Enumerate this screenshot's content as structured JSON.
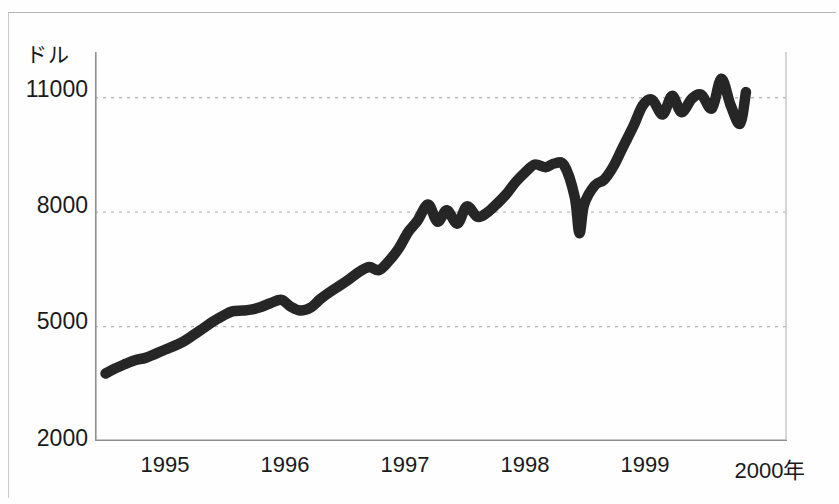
{
  "figure": {
    "background_color": "#fefefe",
    "line_color": "#262626",
    "grid_color": "#b9b9b9",
    "axis_color": "#8f8f8f"
  },
  "chart_data": {
    "type": "line",
    "title": "",
    "subtitle": "",
    "xlabel": "",
    "ylabel": "ドル",
    "x_unit_suffix": "年",
    "grid": true,
    "legend": false,
    "legend_position": "none",
    "ylim": [
      2000,
      12200
    ],
    "xlim": [
      1994.5,
      2000.4
    ],
    "ytick_labels": [
      "11000",
      "8000",
      "5000",
      "2000"
    ],
    "ytick_values": [
      11000,
      8000,
      5000,
      2000
    ],
    "gridline_values": [
      11000,
      8000,
      5000
    ],
    "xtick_labels": [
      "1995",
      "1996",
      "1997",
      "1998",
      "1999",
      "2000年"
    ],
    "xtick_values": [
      1995,
      1996,
      1997,
      1998,
      1999,
      2000
    ],
    "series": [
      {
        "name": "ダウ平均株価",
        "x": [
          1994.59,
          1994.67,
          1994.76,
          1994.84,
          1994.93,
          1995.01,
          1995.1,
          1995.18,
          1995.26,
          1995.34,
          1995.42,
          1995.5,
          1995.59,
          1995.67,
          1995.76,
          1995.84,
          1995.92,
          1996.0,
          1996.09,
          1996.17,
          1996.25,
          1996.34,
          1996.42,
          1996.5,
          1996.59,
          1996.67,
          1996.76,
          1996.84,
          1996.92,
          1997.0,
          1997.09,
          1997.17,
          1997.25,
          1997.34,
          1997.42,
          1997.5,
          1997.59,
          1997.67,
          1997.76,
          1997.84,
          1997.92,
          1998.0,
          1998.09,
          1998.17,
          1998.25,
          1998.34,
          1998.42,
          1998.5,
          1998.59,
          1998.63,
          1998.67,
          1998.76,
          1998.84,
          1998.92,
          1999.0,
          1999.09,
          1999.17,
          1999.25,
          1999.34,
          1999.42,
          1999.5,
          1999.59,
          1999.67,
          1999.76,
          1999.84,
          1999.92,
          2000.0,
          2000.05
        ],
        "values": [
          3770,
          3900,
          4020,
          4120,
          4180,
          4280,
          4400,
          4500,
          4620,
          4780,
          4950,
          5120,
          5280,
          5400,
          5420,
          5450,
          5520,
          5620,
          5700,
          5520,
          5420,
          5500,
          5720,
          5900,
          6080,
          6250,
          6450,
          6560,
          6480,
          6700,
          7050,
          7480,
          7780,
          8200,
          7750,
          8050,
          7700,
          8150,
          7880,
          7980,
          8200,
          8450,
          8800,
          9050,
          9250,
          9180,
          9280,
          9230,
          8400,
          7450,
          8200,
          8700,
          8850,
          9200,
          9700,
          10250,
          10800,
          10950,
          10560,
          11050,
          10620,
          10980,
          11080,
          10720,
          11500,
          10800,
          10320,
          11150
        ]
      }
    ]
  }
}
